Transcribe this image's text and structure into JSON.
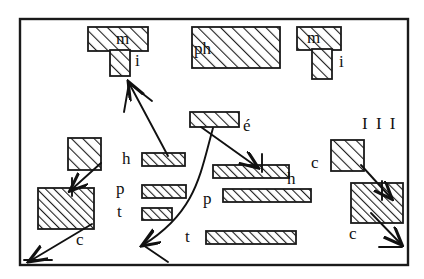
{
  "figure": {
    "frame": {
      "x": 20,
      "y": 19,
      "width": 388,
      "height": 246,
      "stroke": "#1a1a1a",
      "stroke_width": 2.4
    },
    "colors": {
      "ink": "#111111",
      "hatch": "#1f1f1f",
      "background": "#ffffff",
      "block_fill": "#ffffff"
    }
  },
  "blocks": [
    {
      "id": "m-left-bar",
      "label": "",
      "x": 88,
      "y": 27,
      "width": 60,
      "height": 24,
      "hatch": "coarse"
    },
    {
      "id": "i-left-stem",
      "label": "",
      "x": 110,
      "y": 50,
      "width": 20,
      "height": 26,
      "hatch": "coarse"
    },
    {
      "id": "ph-box",
      "label": "",
      "x": 192,
      "y": 27,
      "width": 88,
      "height": 41,
      "hatch": "coarse"
    },
    {
      "id": "m-right-bar",
      "label": "",
      "x": 297,
      "y": 27,
      "width": 44,
      "height": 23,
      "hatch": "coarse"
    },
    {
      "id": "i-right-stem",
      "label": "",
      "x": 312,
      "y": 49,
      "width": 20,
      "height": 30,
      "hatch": "coarse"
    },
    {
      "id": "e-acute-bar",
      "label": "",
      "x": 190,
      "y": 112,
      "width": 49,
      "height": 15,
      "hatch": "coarse"
    },
    {
      "id": "c-left-small",
      "label": "",
      "x": 68,
      "y": 138,
      "width": 33,
      "height": 32,
      "hatch": "coarse"
    },
    {
      "id": "c-left-big",
      "label": "",
      "x": 38,
      "y": 188,
      "width": 56,
      "height": 41,
      "hatch": "dense"
    },
    {
      "id": "c-right-small",
      "label": "",
      "x": 331,
      "y": 140,
      "width": 33,
      "height": 31,
      "hatch": "coarse"
    },
    {
      "id": "c-right-big",
      "label": "",
      "x": 351,
      "y": 183,
      "width": 52,
      "height": 40,
      "hatch": "dense"
    },
    {
      "id": "h-short-bar",
      "label": "",
      "x": 142,
      "y": 153,
      "width": 43,
      "height": 13,
      "hatch": "dense"
    },
    {
      "id": "p-short-bar",
      "label": "",
      "x": 142,
      "y": 185,
      "width": 44,
      "height": 13,
      "hatch": "dense"
    },
    {
      "id": "t-short-bar",
      "label": "",
      "x": 142,
      "y": 208,
      "width": 30,
      "height": 12,
      "hatch": "dense"
    },
    {
      "id": "h-long-bar",
      "label": "",
      "x": 213,
      "y": 165,
      "width": 76,
      "height": 13,
      "hatch": "dense"
    },
    {
      "id": "p-long-bar",
      "label": "",
      "x": 223,
      "y": 189,
      "width": 88,
      "height": 13,
      "hatch": "dense"
    },
    {
      "id": "t-long-bar",
      "label": "",
      "x": 206,
      "y": 231,
      "width": 90,
      "height": 13,
      "hatch": "dense"
    }
  ],
  "labels": [
    {
      "id": "label-m-left",
      "text": "m",
      "x": 116,
      "y": 30,
      "size": 17
    },
    {
      "id": "label-i-left",
      "text": "i",
      "x": 135,
      "y": 52,
      "size": 17
    },
    {
      "id": "label-ph",
      "text": "ph",
      "x": 194,
      "y": 40,
      "size": 17
    },
    {
      "id": "label-m-right",
      "text": "m",
      "x": 307,
      "y": 29,
      "size": 17
    },
    {
      "id": "label-i-right",
      "text": "i",
      "x": 339,
      "y": 53,
      "size": 17
    },
    {
      "id": "label-e-acute",
      "text": "é",
      "x": 243,
      "y": 117,
      "size": 17
    },
    {
      "id": "label-triple-i",
      "text": "I I I",
      "x": 362,
      "y": 115,
      "size": 17
    },
    {
      "id": "label-h-left",
      "text": "h",
      "x": 122,
      "y": 150,
      "size": 17
    },
    {
      "id": "label-p-left",
      "text": "p",
      "x": 116,
      "y": 180,
      "size": 17
    },
    {
      "id": "label-t-left",
      "text": "t",
      "x": 116,
      "y": 203,
      "size": 17
    },
    {
      "id": "label-h-right",
      "text": "h",
      "x": 287,
      "y": 170,
      "size": 17
    },
    {
      "id": "label-p-right",
      "text": "p",
      "x": 203,
      "y": 190,
      "size": 17
    },
    {
      "id": "label-t-right",
      "text": "t",
      "x": 184,
      "y": 228,
      "size": 17
    },
    {
      "id": "label-c-left",
      "text": "c",
      "x": 76,
      "y": 231,
      "size": 17
    },
    {
      "id": "label-c-right-a",
      "text": "c",
      "x": 311,
      "y": 154,
      "size": 17
    },
    {
      "id": "label-c-right-b",
      "text": "c",
      "x": 349,
      "y": 225,
      "size": 17
    }
  ],
  "arrows": [
    {
      "id": "arrow-h-to-mi",
      "from": [
        168,
        156
      ],
      "to": [
        129,
        83
      ],
      "note": "up-left to m/i cluster"
    },
    {
      "id": "arrow-e-to-hbar",
      "from": [
        200,
        127
      ],
      "to": [
        256,
        166
      ],
      "note": "down-right into long h bar"
    },
    {
      "id": "arrow-curve-to-t",
      "from": [
        212,
        127
      ],
      "to": [
        140,
        245
      ],
      "note": "long curve down-left"
    },
    {
      "id": "arrow-csmall-left",
      "from": [
        101,
        162
      ],
      "to": [
        70,
        189
      ],
      "note": "small square into big square"
    },
    {
      "id": "arrow-cbig-left",
      "from": [
        90,
        224
      ],
      "to": [
        28,
        260
      ],
      "note": "big square out to lower-left"
    },
    {
      "id": "arrow-csmall-right",
      "from": [
        361,
        164
      ],
      "to": [
        390,
        197
      ],
      "note": "small square into big square"
    },
    {
      "id": "arrow-cbig-right",
      "from": [
        370,
        212
      ],
      "to": [
        400,
        245
      ],
      "note": "big square out to lower-right"
    }
  ]
}
